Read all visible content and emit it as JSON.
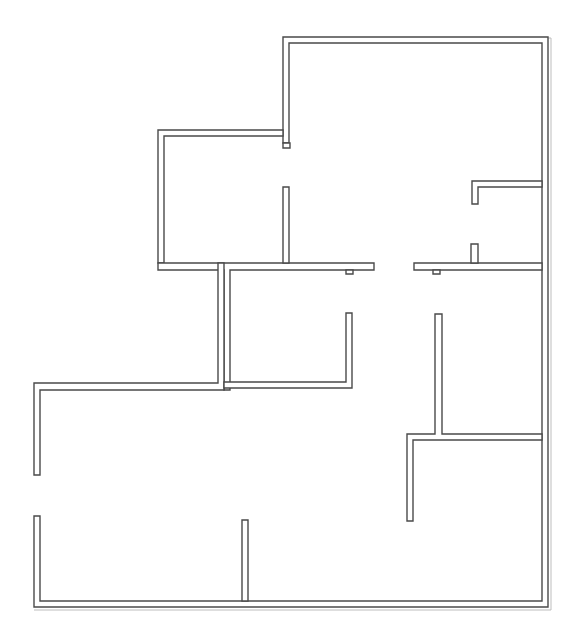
{
  "diagram": {
    "type": "floor-plan",
    "canvas": {
      "width": 578,
      "height": 642,
      "background": "#ffffff"
    },
    "colors": {
      "wall_stroke": "#4a4a4a",
      "wall_fill": "#ffffff",
      "shadow": "#bdbdbd"
    },
    "outer_shadow": "M283,38 L551,38 L551,610 L34,610",
    "walls": [
      {
        "name": "north-wall-upper",
        "points": "283,37 548,37 548,607 34,607 34,516 40,516 40,601 542,601 542,43 289,43 289,143 283,143"
      },
      {
        "name": "north-bump-jamb",
        "points": "283,143 290,143 290,148 283,148"
      },
      {
        "name": "west-room-upper-wall",
        "points": "158,130 283,130 283,136 164,136 164,263 158,263"
      },
      {
        "name": "west-room-lower-wall",
        "points": "158,263 374,263 374,270 230,270 230,390 224,390 224,270 158,270"
      },
      {
        "name": "stub-partition-upper-middle",
        "points": "283,187 289,187 289,263 283,263"
      },
      {
        "name": "jamb-under-center",
        "points": "346,270 353,270 353,274 346,274"
      },
      {
        "name": "west-wing-wall",
        "points": "34,383 218,383 218,263 224,263 224,390 40,390 40,475 34,475"
      },
      {
        "name": "central-room-bottom",
        "points": "224,388 352,388 352,313 346,313 346,382 224,382"
      },
      {
        "name": "east-corridor-wall",
        "points": "414,263 542,263 542,270 420,270 420,270 414,270"
      },
      {
        "name": "east-corridor-jamb",
        "points": "433,270 440,270 440,274 433,274"
      },
      {
        "name": "east-stub-vertical",
        "points": "471,244 478,244 478,263 471,263"
      },
      {
        "name": "east-closet-wall",
        "points": "472,181 542,181 542,187 478,187 478,204 472,204"
      },
      {
        "name": "east-room-partition",
        "points": "435,314 442,314 442,434 542,434 542,440 413,440 413,521 407,521 407,434 435,434"
      },
      {
        "name": "south-stub",
        "points": "242,520 248,520 248,601 242,601"
      }
    ]
  }
}
